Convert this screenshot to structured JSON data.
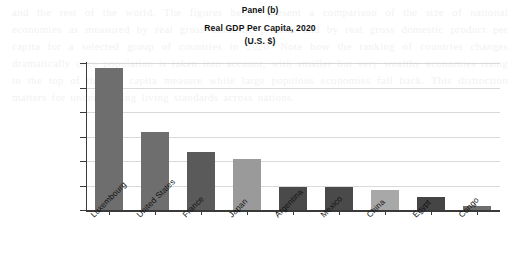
{
  "chart_data": {
    "type": "bar",
    "title": "Real GDP Per Capita, 2020",
    "panel_label": "Panel (b)",
    "units_line": "(U.S. $)",
    "xlabel": "",
    "ylabel": "",
    "ylim": [
      0,
      120000
    ],
    "ytick_values": [
      0,
      20000,
      40000,
      60000,
      80000,
      100000,
      120000
    ],
    "ytick_labels": [
      "0",
      "20,000",
      "40,000",
      "60,000",
      "80,000",
      "100,000",
      "120,000"
    ],
    "grid": true,
    "legend": "none",
    "categories": [
      "Luxembourg",
      "United States",
      "France",
      "Japan",
      "Argentina",
      "Mexico",
      "China",
      "Egypt",
      "Congo"
    ],
    "values": [
      116000,
      64000,
      47000,
      42000,
      19000,
      18500,
      16000,
      11000,
      3000
    ],
    "bar_colors": [
      "#6e6e6e",
      "#6e6e6e",
      "#5a5a5a",
      "#9a9a9a",
      "#4a4a4a",
      "#4a4a4a",
      "#a8a8a8",
      "#454545",
      "#6e6e6e"
    ]
  },
  "background_text": "and the rest of the world. The figures below present a comparison of the size of national economies as measured by real gross domestic product and by real gross domestic product per capita for a selected group of countries in 2020. Note how the ranking of countries changes dramatically once population is taken into account, with smaller but very wealthy economies rising to the top of the per capita measure while large populous economies fall back. This distinction matters for understanding living standards across nations."
}
